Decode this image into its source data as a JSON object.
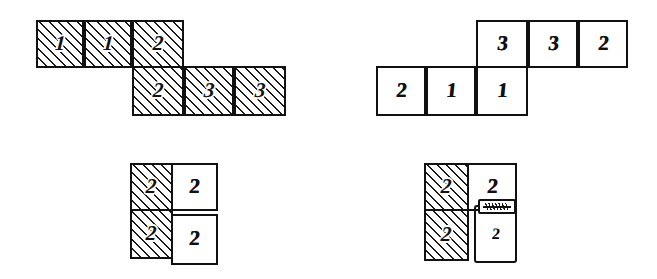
{
  "canvas": {
    "width": 657,
    "height": 279,
    "background": "#ffffff",
    "ink": "#111111",
    "style": "hand-drawn-sketch"
  },
  "figures": [
    {
      "id": "figure-top-left",
      "name": "offset-two-row-hatched-strip",
      "rows": [
        {
          "name": "top-row",
          "col_offset": 0,
          "cells": [
            {
              "value": "1",
              "fill": "hatched"
            },
            {
              "value": "1",
              "fill": "hatched"
            },
            {
              "value": "2",
              "fill": "hatched"
            }
          ]
        },
        {
          "name": "bottom-row",
          "col_offset": 2,
          "cells": [
            {
              "value": "2",
              "fill": "hatched"
            },
            {
              "value": "3",
              "fill": "hatched"
            },
            {
              "value": "3",
              "fill": "hatched"
            }
          ]
        }
      ]
    },
    {
      "id": "figure-top-right",
      "name": "offset-two-row-plain-strip",
      "rows": [
        {
          "name": "top-row",
          "col_offset": 2,
          "cells": [
            {
              "value": "3",
              "fill": "plain"
            },
            {
              "value": "3",
              "fill": "plain"
            },
            {
              "value": "2",
              "fill": "plain"
            }
          ]
        },
        {
          "name": "bottom-row",
          "col_offset": 0,
          "cells": [
            {
              "value": "2",
              "fill": "plain"
            },
            {
              "value": "1",
              "fill": "plain"
            },
            {
              "value": "1",
              "fill": "plain"
            }
          ]
        }
      ]
    },
    {
      "id": "figure-bottom-left",
      "name": "two-by-two-half-hatched-block",
      "rows": [
        {
          "name": "top-row",
          "col_offset": 0,
          "cells": [
            {
              "value": "2",
              "fill": "hatched"
            },
            {
              "value": "2",
              "fill": "plain"
            }
          ]
        },
        {
          "name": "bottom-row",
          "col_offset": 0,
          "cells": [
            {
              "value": "2",
              "fill": "hatched"
            },
            {
              "value": "2",
              "fill": "plain",
              "detached": true
            }
          ]
        }
      ]
    },
    {
      "id": "figure-bottom-right",
      "name": "two-by-two-half-hatched-block-with-tag",
      "rows": [
        {
          "name": "top-row",
          "col_offset": 0,
          "cells": [
            {
              "value": "2",
              "fill": "hatched"
            },
            {
              "value": "2",
              "fill": "plain"
            }
          ]
        },
        {
          "name": "bottom-row",
          "col_offset": 0,
          "cells": [
            {
              "value": "2",
              "fill": "hatched"
            },
            {
              "value": "2",
              "fill": "plain"
            }
          ]
        }
      ],
      "annotation": {
        "name": "hatched-connector-tag",
        "symbol": "hatch-tag",
        "label": ""
      }
    }
  ]
}
